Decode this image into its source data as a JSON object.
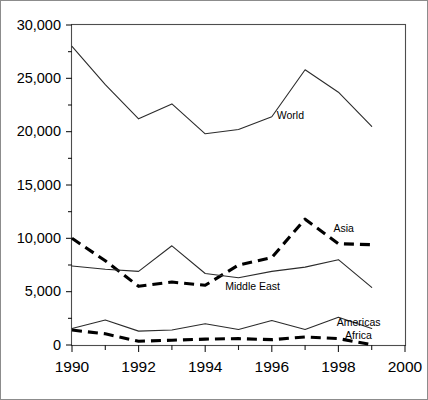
{
  "chart_data": {
    "type": "line",
    "title": "",
    "xlabel": "",
    "ylabel": "",
    "x": [
      1990,
      1991,
      1992,
      1993,
      1994,
      1995,
      1996,
      1997,
      1998,
      1999
    ],
    "xlim": [
      1990,
      2000
    ],
    "ylim": [
      0,
      30000
    ],
    "grid": false,
    "legend_position": "inline-end-of-line",
    "y_ticks": [
      0,
      5000,
      10000,
      15000,
      20000,
      25000,
      30000
    ],
    "y_tick_labels": [
      "0",
      "5,000",
      "10,000",
      "15,000",
      "20,000",
      "25,000",
      "30,000"
    ],
    "y_minor_ticks": [
      2500,
      7500,
      12500,
      17500,
      22500,
      27500
    ],
    "x_ticks": [
      1990,
      1991,
      1992,
      1993,
      1994,
      1995,
      1996,
      1997,
      1998,
      1999,
      2000
    ],
    "x_tick_labels": [
      "1990",
      "",
      "1992",
      "",
      "1994",
      "",
      "1996",
      "",
      "1998",
      "",
      "2000"
    ],
    "x_major_labels": [
      "1990",
      "1992",
      "1994",
      "1996",
      "1998",
      "2000"
    ],
    "series": [
      {
        "name": "World",
        "style": "solid",
        "label": "World",
        "label_x": 1996.15,
        "label_y": 21450,
        "values": [
          28000,
          24400,
          21200,
          22600,
          19800,
          20200,
          21400,
          25800,
          23700,
          20500
        ]
      },
      {
        "name": "Asia",
        "style": "dashed",
        "label": "Asia",
        "label_x": 1997.85,
        "label_y": 10900,
        "values": [
          10000,
          7900,
          5500,
          5900,
          5600,
          7500,
          8200,
          11800,
          9500,
          9400
        ]
      },
      {
        "name": "Middle East",
        "style": "solid",
        "label": "Middle East",
        "label_x": 1994.6,
        "label_y": 5400,
        "values": [
          7400,
          7100,
          6900,
          9300,
          6700,
          6300,
          6900,
          7300,
          8000,
          5400
        ]
      },
      {
        "name": "Americas",
        "style": "solid",
        "label": "Americas",
        "label_x": 1997.95,
        "label_y": 2050,
        "values": [
          1550,
          2350,
          1300,
          1400,
          2000,
          1450,
          2300,
          1450,
          2600,
          1550
        ]
      },
      {
        "name": "Africa",
        "style": "dashed",
        "label": "Africa",
        "label_x": 1998.2,
        "label_y": 800,
        "values": [
          1400,
          1050,
          350,
          450,
          550,
          600,
          500,
          750,
          600,
          30
        ]
      }
    ]
  }
}
